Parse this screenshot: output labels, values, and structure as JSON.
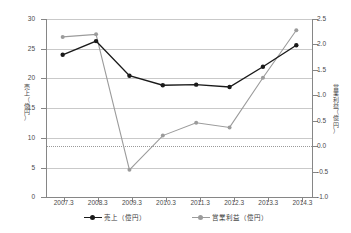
{
  "chart_data": {
    "type": "line",
    "title": "",
    "categories": [
      "2007.3",
      "2008.3",
      "2009.3",
      "2010.3",
      "2011.3",
      "2012.3",
      "2013.3",
      "2014.3"
    ],
    "series": [
      {
        "name": "売上（億円）",
        "axis": "left",
        "color": "#1a1a1a",
        "values": [
          24.0,
          26.3,
          20.5,
          18.9,
          19.0,
          18.6,
          22.0,
          25.6
        ]
      },
      {
        "name": "営業利益（億円）",
        "axis": "right",
        "color": "#9b9b9b",
        "values": [
          2.15,
          2.2,
          -0.45,
          0.22,
          0.47,
          0.38,
          1.35,
          2.28
        ]
      }
    ],
    "xlabel": "",
    "ylabel": "売上（億円）",
    "ylabel_right": "営業利益（億円）",
    "ylim": [
      0,
      30
    ],
    "ylim_right": [
      -1.0,
      2.5
    ],
    "yticks": [
      "0",
      "5",
      "10",
      "15",
      "20",
      "25",
      "30"
    ],
    "yticks_right": [
      "-1.0",
      "-0.5",
      "0.0",
      "0.5",
      "1.0",
      "1.5",
      "2.0",
      "2.5"
    ],
    "grid": true,
    "zero_reference_line": 0.0,
    "legend_position": "bottom"
  },
  "axes": {
    "left_title_chars": [
      "売",
      "上",
      "（",
      "億",
      "円",
      "）"
    ],
    "right_title_chars": [
      "営",
      "業",
      "利",
      "益",
      "（",
      "億",
      "円",
      "）"
    ]
  },
  "legend": {
    "items": [
      {
        "label": "売上（億円）",
        "color": "#1a1a1a"
      },
      {
        "label": "営業利益（億円）",
        "color": "#9b9b9b"
      }
    ]
  }
}
